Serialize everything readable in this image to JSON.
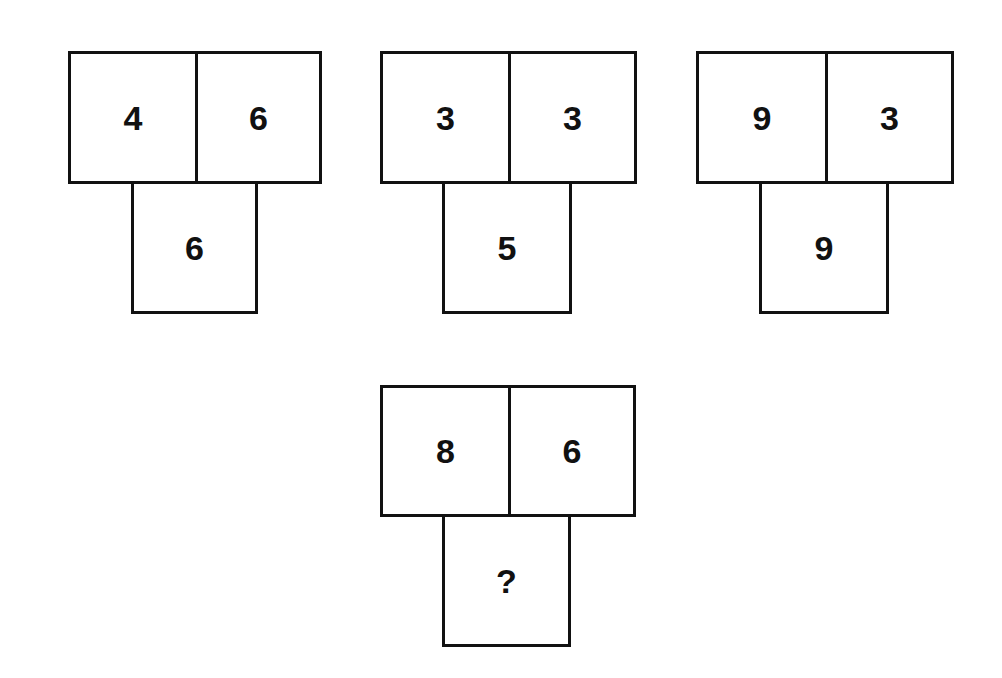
{
  "puzzle": {
    "type": "number-pattern",
    "instruction": "",
    "examples": [
      {
        "top_left": "4",
        "top_right": "6",
        "bottom": "6"
      },
      {
        "top_left": "3",
        "top_right": "3",
        "bottom": "5"
      },
      {
        "top_left": "9",
        "top_right": "3",
        "bottom": "9"
      }
    ],
    "question": {
      "top_left": "8",
      "top_right": "6",
      "bottom": "?"
    }
  },
  "colors": {
    "background": "#ffffff",
    "border": "#111111",
    "text": "#111111"
  }
}
